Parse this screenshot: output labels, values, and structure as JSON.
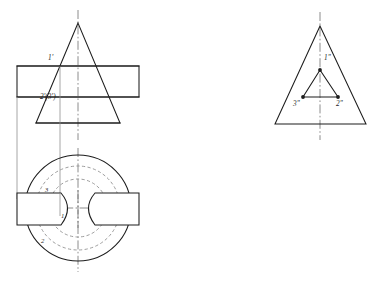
{
  "sheet": {
    "title": "Orthographic Projection - Cone with Keyway Slot",
    "background_color": "#ffffff",
    "width": 379,
    "height": 281
  },
  "styles": {
    "solid_color": "#1d1d1d",
    "hidden_color": "#8d8d8d",
    "center_color": "#6f6f6f",
    "projection_color": "#8a8a8a"
  },
  "views": {
    "front_view": {
      "name": "front-view",
      "description": "Triangular front elevation of cone with horizontal through-slot",
      "labels": [
        {
          "id": "front-label-1",
          "text": "1'",
          "x": 48,
          "y": 60
        },
        {
          "id": "front-label-2-3",
          "text": "2'(3')",
          "x": 40,
          "y": 99
        }
      ],
      "triangle": {
        "apex": {
          "x": 78,
          "y": 23
        },
        "base_left": {
          "x": 36,
          "y": 123
        },
        "base_right": {
          "x": 120,
          "y": 123
        }
      },
      "slot_rect": {
        "left": 17,
        "right": 139,
        "top": 66,
        "bottom": 97
      },
      "centerline_x": 78
    },
    "top_view": {
      "name": "top-view",
      "description": "Circular plan view with two hidden circles and two keyway notches",
      "labels": [
        {
          "id": "top-label-3",
          "text": "3",
          "x": 45,
          "y": 190
        },
        {
          "id": "top-label-1",
          "text": "1",
          "x": 60,
          "y": 216
        },
        {
          "id": "top-label-2",
          "text": "2",
          "x": 42,
          "y": 241
        }
      ],
      "outer_circle": {
        "cx": 78,
        "cy": 208,
        "r": 53
      },
      "hidden_circles": [
        {
          "cx": 78,
          "cy": 208,
          "r": 42
        },
        {
          "cx": 78,
          "cy": 208,
          "r": 29
        }
      ],
      "notches": [
        {
          "side": "left",
          "x": 17,
          "y": 193,
          "w": 44,
          "h": 32
        },
        {
          "side": "right",
          "x": 95,
          "y": 193,
          "w": 44,
          "h": 32
        }
      ],
      "centerline_x": 78,
      "centerline_y": 208
    },
    "side_view": {
      "name": "side-view",
      "description": "Triangular side view with inner triangle showing three marked points",
      "labels": [
        {
          "id": "side-label-1",
          "text": "1\"",
          "x": 326,
          "y": 58
        },
        {
          "id": "side-label-3",
          "text": "3\"",
          "x": 296,
          "y": 104
        },
        {
          "id": "side-label-2",
          "text": "2\"",
          "x": 337,
          "y": 104
        }
      ],
      "outer_triangle": {
        "apex": {
          "x": 320,
          "y": 26
        },
        "base_left": {
          "x": 275,
          "y": 124
        },
        "base_right": {
          "x": 366,
          "y": 124
        }
      },
      "inner_triangle": {
        "apex": {
          "x": 320,
          "y": 70
        },
        "base_left": {
          "x": 303,
          "y": 97
        },
        "base_right": {
          "x": 338,
          "y": 97
        }
      },
      "vertex_dots": [
        {
          "id": "dot-1",
          "x": 320,
          "y": 70
        },
        {
          "id": "dot-3",
          "x": 303,
          "y": 97
        },
        {
          "id": "dot-2",
          "x": 338,
          "y": 97
        }
      ],
      "centerline_x": 320
    }
  },
  "projection_lines": [
    {
      "id": "proj-left-edge",
      "x": 17,
      "y1": 97,
      "y2": 199
    },
    {
      "id": "proj-point-1",
      "x": 60,
      "y1": 66,
      "y2": 214
    }
  ]
}
